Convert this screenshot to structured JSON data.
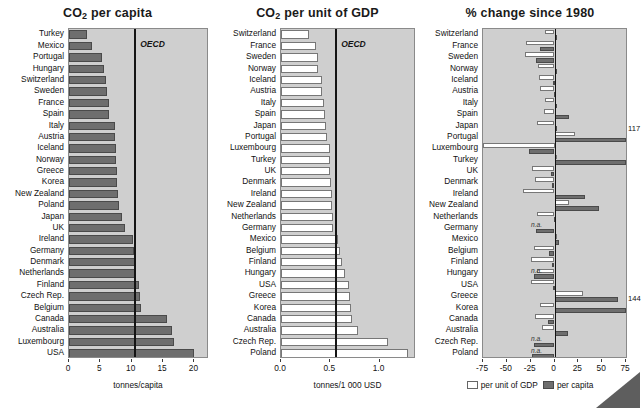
{
  "chart_data": [
    {
      "type": "bar",
      "title": "CO2 per capita",
      "title_html": "CO₂ per capita",
      "orientation": "horizontal",
      "xlabel": "tonnes/capita",
      "ylabel": "",
      "xlim": [
        0,
        22
      ],
      "xticks": [
        0,
        5,
        10,
        15,
        20
      ],
      "xticklabels": [
        "0",
        "5",
        "10",
        "15",
        "20"
      ],
      "grid": false,
      "series_name": "per capita",
      "series_color": "#6e6e6e",
      "reference_line": {
        "label": "OECD",
        "value": 10.4
      },
      "categories": [
        "Turkey",
        "Mexico",
        "Portugal",
        "Hungary",
        "Switzerland",
        "Sweden",
        "France",
        "Spain",
        "Italy",
        "Austria",
        "Iceland",
        "Norway",
        "Greece",
        "Korea",
        "New Zealand",
        "Poland",
        "Japan",
        "UK",
        "Ireland",
        "Germany",
        "Denmark",
        "Netherlands",
        "Finland",
        "Czech Rep.",
        "Belgium",
        "Canada",
        "Australia",
        "Luxembourg",
        "USA"
      ],
      "values": [
        2.9,
        3.6,
        5.3,
        5.6,
        5.9,
        6.0,
        6.3,
        6.4,
        7.3,
        7.4,
        7.5,
        7.5,
        7.6,
        7.6,
        7.8,
        7.9,
        8.5,
        9.0,
        10.2,
        10.3,
        10.5,
        10.6,
        11.1,
        11.3,
        11.5,
        15.6,
        16.4,
        16.7,
        20.0
      ],
      "unit": "tonnes/capita"
    },
    {
      "type": "bar",
      "title": "CO2 per unit of GDP",
      "title_html": "CO₂ per unit of GDP",
      "orientation": "horizontal",
      "xlabel": "tonnes/1 000 USD",
      "ylabel": "",
      "xlim": [
        0,
        1.35
      ],
      "xticks": [
        0.0,
        0.5,
        1.0
      ],
      "xticklabels": [
        "0.0",
        "0.5",
        "1.0"
      ],
      "grid": false,
      "series_name": "per unit of GDP",
      "series_color": "#ffffff",
      "reference_line": {
        "label": "OECD",
        "value": 0.55
      },
      "categories": [
        "Switzerland",
        "France",
        "Sweden",
        "Norway",
        "Iceland",
        "Austria",
        "Italy",
        "Spain",
        "Japan",
        "Portugal",
        "Luxembourg",
        "Turkey",
        "UK",
        "Denmark",
        "Ireland",
        "New Zealand",
        "Netherlands",
        "Germany",
        "Mexico",
        "Belgium",
        "Finland",
        "Hungary",
        "USA",
        "Greece",
        "Korea",
        "Canada",
        "Australia",
        "Czech Rep.",
        "Poland"
      ],
      "values": [
        0.28,
        0.36,
        0.38,
        0.38,
        0.42,
        0.42,
        0.44,
        0.45,
        0.46,
        0.47,
        0.5,
        0.5,
        0.5,
        0.51,
        0.52,
        0.52,
        0.53,
        0.53,
        0.58,
        0.6,
        0.62,
        0.65,
        0.69,
        0.7,
        0.71,
        0.72,
        0.78,
        1.09,
        1.29
      ],
      "unit": "tonnes/1 000 USD"
    },
    {
      "type": "bar",
      "title": "% change since 1980",
      "title_html": "% change since 1980",
      "orientation": "horizontal",
      "grouped": true,
      "xlabel": "",
      "ylabel": "",
      "xlim": [
        -75,
        75
      ],
      "xticks": [
        -75,
        -50,
        -25,
        0,
        25,
        50,
        75
      ],
      "xticklabels": [
        "-75",
        "-50",
        "-25",
        "0",
        "25",
        "50",
        "75"
      ],
      "grid": false,
      "zero_line": 0,
      "legend": [
        "per unit of GDP",
        "per capita"
      ],
      "legend_position": "bottom",
      "categories": [
        "Switzerland",
        "France",
        "Sweden",
        "Norway",
        "Iceland",
        "Austria",
        "Italy",
        "Spain",
        "Japan",
        "Portugal",
        "Luxembourg",
        "Turkey",
        "UK",
        "Denmark",
        "Ireland",
        "New Zealand",
        "Netherlands",
        "Germany",
        "Mexico",
        "Belgium",
        "Finland",
        "Hungary",
        "USA",
        "Greece",
        "Korea",
        "Canada",
        "Australia",
        "Czech Rep.",
        "Poland"
      ],
      "series": [
        {
          "name": "per unit of GDP",
          "color": "#ffffff",
          "values": [
            -10,
            -30,
            -31,
            -17,
            -16,
            -15,
            -10,
            -11,
            -18,
            22,
            -75,
            3,
            -24,
            -20,
            -33,
            15,
            -18,
            null,
            0,
            -22,
            -25,
            -18,
            -25,
            30,
            -15,
            -20,
            -13,
            null,
            null
          ]
        },
        {
          "name": "per capita",
          "color": "#6e6e6e",
          "values": [
            3,
            -15,
            -19,
            3,
            -2,
            -1,
            2,
            15,
            2,
            117,
            -27,
            144,
            -4,
            -3,
            32,
            47,
            -1,
            -19,
            5,
            -6,
            -3,
            -22,
            -2,
            67,
            144,
            -7,
            14,
            -21,
            -24
          ]
        }
      ],
      "annotations": [
        {
          "category": "Portugal",
          "series": "per capita",
          "text": "117"
        },
        {
          "category": "Korea",
          "series": "per capita",
          "text": "144"
        }
      ],
      "na_markers": [
        {
          "category": "Germany",
          "series": "per unit of GDP",
          "text": "n.a."
        },
        {
          "category": "Hungary",
          "series": "per unit of GDP",
          "text": "n.a."
        },
        {
          "category": "Czech Rep.",
          "series": "per unit of GDP",
          "text": "n.a."
        },
        {
          "category": "Poland",
          "series": "per unit of GDP",
          "text": "n.a."
        }
      ],
      "unit": "%"
    }
  ]
}
